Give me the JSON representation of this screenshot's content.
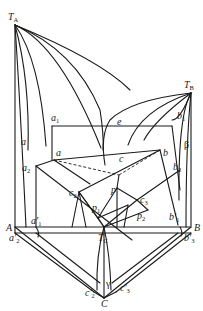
{
  "figure": {
    "type": "ternary-eutectic-phase-diagram"
  },
  "labels": {
    "TA": {
      "main": "T",
      "sub": "A"
    },
    "TB": {
      "main": "T",
      "sub": "B"
    },
    "TC": {
      "main": "T",
      "sub": "C"
    },
    "A": "A",
    "B": "B",
    "C": "C",
    "e": "e",
    "a": "a",
    "a_inner": "a",
    "a1": {
      "main": "a",
      "sub": "1"
    },
    "a2": {
      "main": "a",
      "sub": "2"
    },
    "a1p": {
      "main": "a'",
      "sub": "1"
    },
    "a2p": {
      "main": "a'",
      "sub": "2"
    },
    "b": "b",
    "b1": {
      "main": "b",
      "sub": "1"
    },
    "b2": {
      "main": "b",
      "sub": "2"
    },
    "b1p": {
      "main": "b'",
      "sub": "1"
    },
    "b3p": {
      "main": "b'",
      "sub": "3"
    },
    "beta": "β",
    "c": "c",
    "c2": {
      "main": "c",
      "sub": "2"
    },
    "c3": {
      "main": "c",
      "sub": "3"
    },
    "c2p": {
      "main": "c'",
      "sub": "2"
    },
    "c3p": {
      "main": "c'",
      "sub": "3"
    },
    "gamma": "γ",
    "p": "p",
    "p1": {
      "main": "p",
      "sub": "1"
    },
    "p2": {
      "main": "p",
      "sub": "2"
    }
  }
}
